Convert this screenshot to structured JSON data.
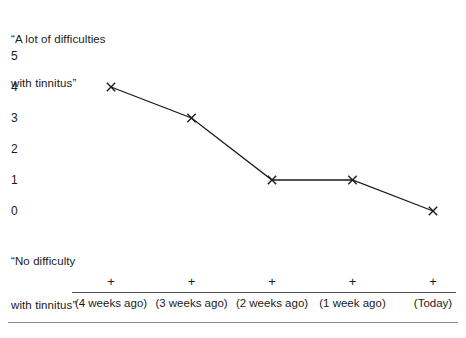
{
  "chart_data": {
    "type": "line",
    "title": "",
    "xlabel": "",
    "ylabel": "",
    "categories": [
      "(4 weeks ago)",
      "(3 weeks ago)",
      "(2 weeks ago)",
      "(1 week ago)",
      "(Today)"
    ],
    "values": [
      4,
      3,
      1,
      1,
      0
    ],
    "ylim": [
      0,
      5
    ],
    "y_ticks": [
      5,
      4,
      3,
      2,
      1,
      0
    ],
    "grid": false,
    "legend": "none",
    "marker": "x",
    "line_color": "#1a1a1a",
    "axis_color": "#555555",
    "rule_color": "#8a8a8a",
    "background": "#ffffff",
    "scale_anchor_high": "“A lot of difficulties\nwith tinnitus”",
    "scale_anchor_low": "“No difficulty\nwith tinnitus”",
    "annotations": []
  },
  "anchors": {
    "high_line1": "“A lot of difficulties",
    "high_line2": "with tinnitus”",
    "low_line1": "“No difficulty",
    "low_line2": "with tinnitus”"
  },
  "y_axis": {
    "labels": [
      "5",
      "4",
      "3",
      "2",
      "1",
      "0"
    ]
  },
  "x_axis": {
    "tick_glyph": "+",
    "labels": [
      "(4 weeks ago)",
      "(3 weeks ago)",
      "(2 weeks ago)",
      "(1 week ago)",
      "(Today)"
    ]
  }
}
